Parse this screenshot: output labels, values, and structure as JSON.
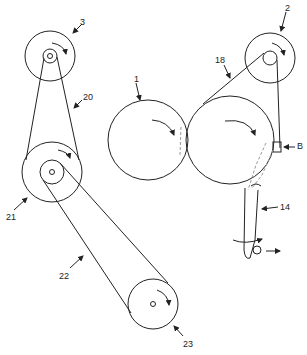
{
  "diagram": {
    "stroke_color": "#222222",
    "dashed_color": "#999999",
    "labels": [
      {
        "id": "3",
        "text": "3",
        "x": 80,
        "y": 18
      },
      {
        "id": "2",
        "text": "2",
        "x": 285,
        "y": 4
      },
      {
        "id": "20",
        "text": "20",
        "x": 83,
        "y": 93
      },
      {
        "id": "18",
        "text": "18",
        "x": 215,
        "y": 56
      },
      {
        "id": "1",
        "text": "1",
        "x": 134,
        "y": 75
      },
      {
        "id": "B",
        "text": "B",
        "x": 297,
        "y": 145
      },
      {
        "id": "14",
        "text": "14",
        "x": 280,
        "y": 204
      },
      {
        "id": "21",
        "text": "21",
        "x": 6,
        "y": 213
      },
      {
        "id": "22",
        "text": "22",
        "x": 59,
        "y": 272
      },
      {
        "id": "23",
        "text": "23",
        "x": 183,
        "y": 340
      }
    ],
    "components": [
      {
        "name": "pulley-3",
        "label": "3"
      },
      {
        "name": "pulley-2",
        "label": "2"
      },
      {
        "name": "roller-1",
        "label": "1"
      },
      {
        "name": "main-drum",
        "label": ""
      },
      {
        "name": "pulley-21",
        "label": "21"
      },
      {
        "name": "pulley-23",
        "label": "23"
      },
      {
        "name": "belt-20",
        "label": "20"
      },
      {
        "name": "belt-18",
        "label": "18"
      },
      {
        "name": "belt-22",
        "label": "22"
      },
      {
        "name": "lever-14",
        "label": "14"
      },
      {
        "name": "block-B",
        "label": "B"
      }
    ]
  }
}
